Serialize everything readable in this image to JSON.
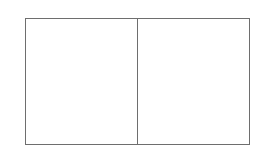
{
  "figure": {
    "type": "two-panel-frame",
    "title": "",
    "background_color": "#ffffff",
    "width": 260,
    "height": 151
  },
  "frame": {
    "border_color": "#6e6e6e",
    "border_width": 1,
    "fill_color": "#ffffff",
    "left": 25,
    "top": 18,
    "width": 225,
    "height": 127
  },
  "divider": {
    "orientation": "vertical",
    "color": "#6e6e6e",
    "width": 1,
    "x": 137
  },
  "panels": [
    {
      "id": "left",
      "label": "",
      "content": "",
      "fill_color": "#ffffff",
      "width": 111,
      "height": 125
    },
    {
      "id": "right",
      "label": "",
      "content": "",
      "fill_color": "#ffffff",
      "width": 112,
      "height": 125
    }
  ]
}
